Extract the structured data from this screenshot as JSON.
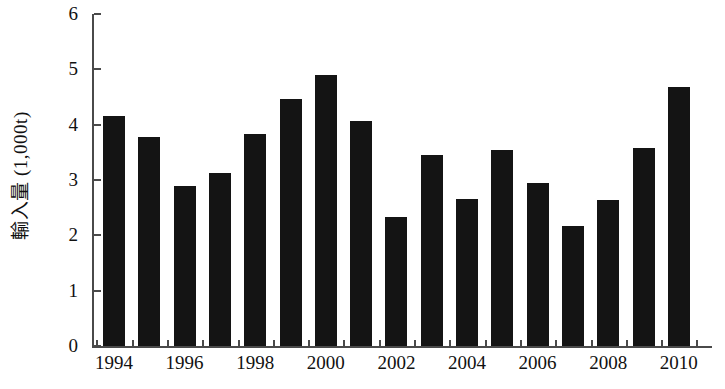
{
  "chart_data": {
    "type": "bar",
    "title": "",
    "subtitle": "",
    "xlabel": "",
    "ylabel": "輸入量 (1,000t)",
    "categories": [
      "1994",
      "1995",
      "1996",
      "1997",
      "1998",
      "1999",
      "2000",
      "2001",
      "2002",
      "2003",
      "2004",
      "2005",
      "2006",
      "2007",
      "2008",
      "2009",
      "2010"
    ],
    "values": [
      4.15,
      3.78,
      2.9,
      3.12,
      3.83,
      4.47,
      4.9,
      4.06,
      2.33,
      3.45,
      2.65,
      3.55,
      2.94,
      2.17,
      2.64,
      3.58,
      4.68
    ],
    "ylim": [
      0,
      6
    ],
    "ytick_labels": [
      "0",
      "1",
      "2",
      "3",
      "4",
      "5",
      "6"
    ],
    "ytick_values": [
      0,
      1,
      2,
      3,
      4,
      5,
      6
    ],
    "xtick_labels": [
      "1994",
      "1996",
      "1998",
      "2000",
      "2002",
      "2004",
      "2006",
      "2008",
      "2010"
    ],
    "xtick_categories": [
      "1994",
      "1996",
      "1998",
      "2000",
      "2002",
      "2004",
      "2006",
      "2008",
      "2010"
    ],
    "grid": false,
    "legend": null,
    "bar_color": "#141414",
    "axis_color": "#4a4a4a",
    "text_color": "#111111",
    "background_color": "#ffffff",
    "annotations": []
  }
}
